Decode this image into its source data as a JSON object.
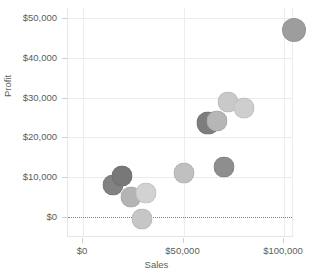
{
  "chart_data": {
    "type": "scatter",
    "title": "",
    "xlabel": "Sales",
    "ylabel": "Profit",
    "xlim": [
      -7500,
      105000
    ],
    "ylim": [
      -5000,
      52500
    ],
    "grid": true,
    "legend": null,
    "x_ticks": [
      0,
      50000,
      100000
    ],
    "x_tick_labels": [
      "$0",
      "$50,000",
      "$100,000"
    ],
    "y_ticks": [
      0,
      10000,
      20000,
      30000,
      40000,
      50000
    ],
    "y_tick_labels": [
      "$0",
      "$10,000",
      "$20,000",
      "$30,000",
      "$40,000",
      "$50,000"
    ],
    "reference_line": {
      "axis": "y",
      "value": 0,
      "style": "dotted",
      "color": "#7c7c7c"
    },
    "points": [
      {
        "x": 15000,
        "y": 8000,
        "size": 21,
        "color": "#828282"
      },
      {
        "x": 19500,
        "y": 10200,
        "size": 21,
        "color": "#787878"
      },
      {
        "x": 24000,
        "y": 5000,
        "size": 21,
        "color": "#b4b4b4"
      },
      {
        "x": 31500,
        "y": 6000,
        "size": 21,
        "color": "#d2d2d2"
      },
      {
        "x": 29500,
        "y": -500,
        "size": 21,
        "color": "#c6c6c6"
      },
      {
        "x": 50000,
        "y": 11000,
        "size": 21,
        "color": "#c0c0c0"
      },
      {
        "x": 70000,
        "y": 12500,
        "size": 21,
        "color": "#8e8e8e"
      },
      {
        "x": 62000,
        "y": 23500,
        "size": 23,
        "color": "#7d7d7d"
      },
      {
        "x": 66500,
        "y": 24200,
        "size": 21,
        "color": "#b6b6b6"
      },
      {
        "x": 72000,
        "y": 29000,
        "size": 21,
        "color": "#c9c9c9"
      },
      {
        "x": 80000,
        "y": 27500,
        "size": 21,
        "color": "#cecece"
      },
      {
        "x": 105000,
        "y": 47000,
        "size": 24,
        "color": "#9d9d9d"
      }
    ]
  },
  "axis": {
    "x_title": "Sales",
    "y_title": "Profit"
  }
}
